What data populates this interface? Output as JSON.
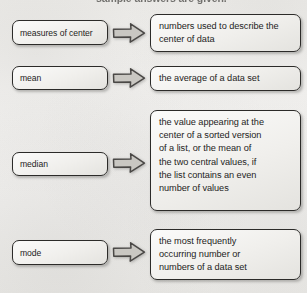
{
  "page": {
    "header_partial_text": "sample answers are given.",
    "background_color": "#f2f1ef",
    "box_border_color": "#2c2b29",
    "arrow_fill_color": "#c9c7c2",
    "arrow_stroke_color": "#4a4846",
    "text_color": "#1e1d1c"
  },
  "rows": [
    {
      "term": "measures of center",
      "arrow_icon": "right-block-arrow-icon",
      "definition_lines": [
        "numbers used to describe the",
        "center of data"
      ]
    },
    {
      "term": "mean",
      "arrow_icon": "right-block-arrow-icon",
      "definition_lines": [
        "the average of a data set"
      ]
    },
    {
      "term": "median",
      "arrow_icon": "right-block-arrow-icon",
      "definition_lines": [
        "the value appearing at the",
        "center of a sorted version",
        "of a list, or the mean of",
        "the two central values, if",
        "the list contains an even",
        "number of values"
      ]
    },
    {
      "term": "mode",
      "arrow_icon": "right-block-arrow-icon",
      "definition_lines": [
        "the most frequently",
        "occurring number or",
        "numbers of a data set"
      ]
    }
  ]
}
